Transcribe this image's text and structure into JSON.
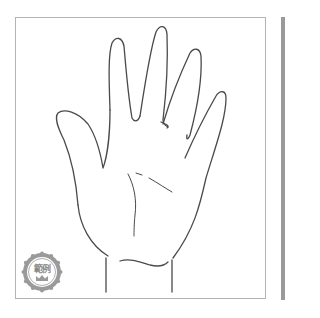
{
  "illustration": {
    "subject": "hand-outline-palm",
    "stroke_color": "#4a4a4a",
    "frame_border_color": "#b4b4b4"
  },
  "badge": {
    "label": "範例",
    "icon": "crown-icon",
    "color": "#9a9a9a"
  },
  "scrollbar": {
    "color": "#9a9a9a"
  }
}
